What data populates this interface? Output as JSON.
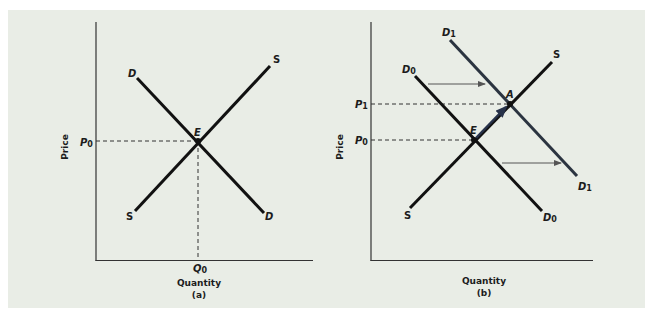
{
  "colors": {
    "background": "#e9ede6",
    "curve": "#111111",
    "shifted_curve": "#2b3440",
    "dashed": "#333333",
    "arrow": "#555555",
    "movement_arrow": "#27324a"
  },
  "panel_a": {
    "caption": "(a)",
    "x_axis_label": "Quantity",
    "y_axis_label": "Price",
    "demand_label_top": "D",
    "demand_label_bottom": "D",
    "supply_label_top": "S",
    "supply_label_bottom": "S",
    "equilibrium_label": "E",
    "price_tick": "P",
    "price_tick_sub": "0",
    "quantity_tick": "Q",
    "quantity_tick_sub": "0"
  },
  "panel_b": {
    "caption": "(b)",
    "x_axis_label": "Quantity",
    "y_axis_label": "Price",
    "d0_label_top": "D",
    "d0_label_top_sub": "0",
    "d0_label_bottom": "D",
    "d0_label_bottom_sub": "0",
    "d1_label_top": "D",
    "d1_label_top_sub": "1",
    "d1_label_bottom": "D",
    "d1_label_bottom_sub": "1",
    "supply_label_top": "S",
    "supply_label_bottom": "S",
    "old_equilibrium_label": "E",
    "new_equilibrium_label": "A",
    "p1_tick": "P",
    "p1_tick_sub": "1",
    "p0_tick": "P",
    "p0_tick_sub": "0"
  }
}
